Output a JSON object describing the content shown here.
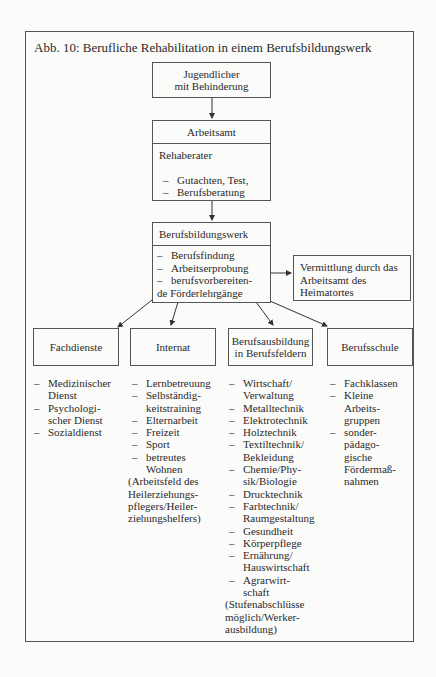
{
  "title": "Abb. 10: Berufliche Rehabilitation in einem Berufsbildungswerk",
  "nodes": {
    "jugendlicher": {
      "line1": "Jugendlicher",
      "line2": "mit Behinderung"
    },
    "arbeitsamt": {
      "header": "Arbeitsamt",
      "subtitle": "Rehaberater",
      "items": [
        "Gutachten, Test,",
        "Berufsberatung"
      ]
    },
    "berufsbildungswerk": {
      "header": "Berufsbildungswerk",
      "items": [
        "Berufsfindung",
        "Arbeitserprobung",
        "berufsvorbereiten-"
      ],
      "continuation": "de Förderlehrgänge"
    },
    "vermittlung": {
      "text": "Vermittlung durch das Arbeitsamt des Heimatortes"
    },
    "fachdienste": {
      "label": "Fachdienste"
    },
    "internat": {
      "label": "Internat"
    },
    "berufsausbildung": {
      "line1": "Berufsausbildung",
      "line2": "in Berufsfeldern"
    },
    "berufsschule": {
      "label": "Berufsschule"
    }
  },
  "lists": {
    "fachdienste": [
      [
        "Medizinischer",
        "Dienst"
      ],
      [
        "Psychologi-",
        "scher Dienst"
      ],
      [
        "Sozialdienst"
      ]
    ],
    "internat": [
      [
        "Lernbetreuung"
      ],
      [
        "Selbständig-",
        "keitstraining"
      ],
      [
        "Elternarbeit"
      ],
      [
        "Freizeit"
      ],
      [
        "Sport"
      ],
      [
        "betreutes",
        "Wohnen"
      ]
    ],
    "internat_note": [
      "(Arbeitsfeld des",
      "Heilerziehungs-",
      "pflegers/Heiler-",
      "ziehungshelfers)"
    ],
    "berufsausbildung": [
      [
        "Wirtschaft/",
        "Verwaltung"
      ],
      [
        "Metalltechnik"
      ],
      [
        "Elektrotechnik"
      ],
      [
        "Holztechnik"
      ],
      [
        "Textiltechnik/",
        "Bekleidung"
      ],
      [
        "Chemie/Phy-",
        "sik/Biologie"
      ],
      [
        "Drucktechnik"
      ],
      [
        "Farbtechnik/",
        "Raumgestaltung"
      ],
      [
        "Gesundheit"
      ],
      [
        "Körperpflege"
      ],
      [
        "Ernährung/",
        "Hauswirtschaft"
      ],
      [
        "Agrarwirt-",
        "schaft"
      ]
    ],
    "berufsausbildung_note": [
      "(Stufenabschlüsse",
      "möglich/Werker-",
      "ausbildung)"
    ],
    "berufsschule": [
      [
        "Fachklassen"
      ],
      [
        "Kleine",
        "Arbeits-",
        "gruppen"
      ],
      [
        "sonder-",
        "pädago-",
        "gische",
        "Fördermaß-",
        "nahmen"
      ]
    ]
  }
}
